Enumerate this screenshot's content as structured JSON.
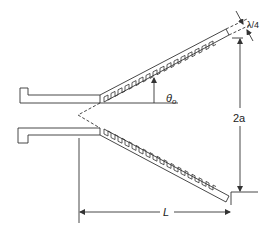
{
  "diagram": {
    "type": "corrugated-horn-cross-section",
    "labels": {
      "angle": "θ",
      "angle_sub": "o",
      "aperture": "2a",
      "length": "L",
      "groove_depth": "λ/4"
    },
    "colors": {
      "line": "#333333",
      "background": "#ffffff"
    },
    "corrugations": {
      "upper_count": 16,
      "lower_count": 16
    }
  }
}
